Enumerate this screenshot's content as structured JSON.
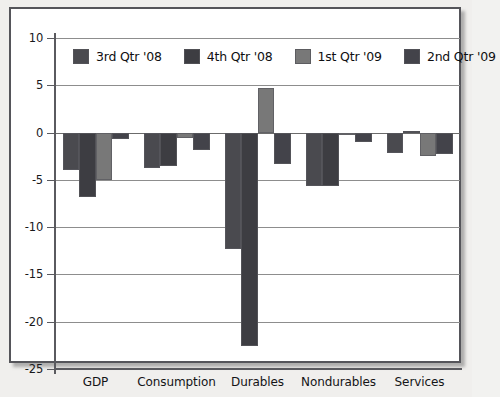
{
  "chart_data": {
    "type": "bar",
    "title": "",
    "subtitle": "",
    "xlabel": "",
    "ylabel": "",
    "ylim": [
      -25,
      10
    ],
    "ytick_values": [
      10,
      5,
      0,
      -5,
      -10,
      -15,
      -20,
      -25
    ],
    "ytick_labels": [
      "10",
      "5",
      "0",
      "-5",
      "-10",
      "-15",
      "-20",
      "-25"
    ],
    "grid": true,
    "grid_axis": "y",
    "legend_position": "top-inside",
    "categories": [
      "GDP",
      "Consumption",
      "Durables",
      "Nondurables",
      "Services"
    ],
    "series": [
      {
        "name": "3rd Qtr '08",
        "color": "#4a4a4f",
        "values": [
          -4.0,
          -3.8,
          -12.3,
          -5.7,
          -2.2
        ]
      },
      {
        "name": "4th Qtr '08",
        "color": "#3d3d42",
        "values": [
          -6.8,
          -3.5,
          -22.6,
          -5.7,
          0.2
        ]
      },
      {
        "name": "1st Qtr '09",
        "color": "#787878",
        "values": [
          -5.0,
          -0.6,
          4.7,
          -0.2,
          -2.5
        ]
      },
      {
        "name": "2nd Qtr '09",
        "color": "#43434a",
        "values": [
          -0.7,
          -1.8,
          -3.3,
          -1.0,
          -2.3
        ]
      }
    ]
  },
  "legend": {
    "items": [
      {
        "label": "3rd Qtr '08",
        "color": "#4a4a4f"
      },
      {
        "label": "4th Qtr '08",
        "color": "#3d3d42"
      },
      {
        "label": "1st Qtr '09",
        "color": "#787878"
      },
      {
        "label": "2nd Qtr '09",
        "color": "#43434a"
      }
    ]
  },
  "colors": {
    "page_background": "#f0efed",
    "plot_background": "#ffffff",
    "frame_border": "#55555a",
    "gridline": "#8d8d8d",
    "axis": "#5a5a5f",
    "text": "#141417"
  }
}
